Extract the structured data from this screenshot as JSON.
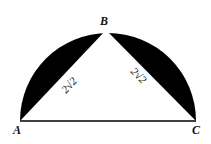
{
  "diagram": {
    "type": "geometry",
    "points": {
      "A": {
        "label": "A"
      },
      "B": {
        "label": "B"
      },
      "C": {
        "label": "C"
      }
    },
    "sides": {
      "AB": {
        "label": "2√2"
      },
      "BC": {
        "label": "2√2"
      }
    },
    "colors": {
      "shaded": "#000000",
      "background": "#ffffff",
      "stroke": "#000000"
    }
  }
}
